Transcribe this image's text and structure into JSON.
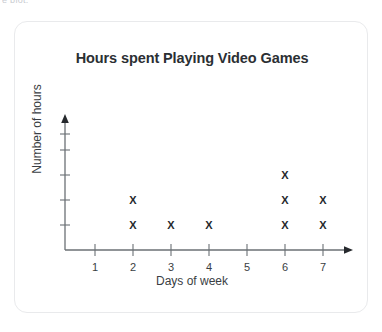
{
  "artifact": {
    "clipped_text": "e plot."
  },
  "chart_data": {
    "type": "scatter",
    "plot_style": "dot-plot-x-marks",
    "title": "Hours spent Playing Video Games",
    "xlabel": "Days of week",
    "ylabel": "Number of hours",
    "categories": [
      "1",
      "2",
      "3",
      "4",
      "5",
      "6",
      "7"
    ],
    "x": [
      1,
      2,
      3,
      4,
      5,
      6,
      7
    ],
    "values": [
      0,
      2,
      1,
      1,
      0,
      3,
      2
    ],
    "marker": "X",
    "marker_color": "#26292d",
    "xlim": [
      0,
      7
    ],
    "ylim": [
      0,
      5
    ],
    "x_tick_labels": [
      "1",
      "2",
      "3",
      "4",
      "5",
      "6",
      "7"
    ],
    "y_tick_labels": [
      "",
      "",
      "",
      "",
      ""
    ],
    "y_tick_count": 5,
    "grid": false,
    "legend": null,
    "axis_arrows": [
      "x-right",
      "y-up"
    ],
    "axis_color": "#6b7075"
  },
  "card": {
    "border_color": "#e9eaec",
    "background": "#ffffff"
  }
}
